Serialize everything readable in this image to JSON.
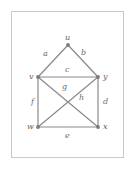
{
  "figure": {
    "kind": "graph-diagram",
    "frame": {
      "border_color": "#c9c9c9",
      "background_color": "#ffffff"
    },
    "style": {
      "edge_color": "#8a8a8a",
      "vertex_color": "#7a7a7a",
      "label_color": "#6b6b6b",
      "edge_width": 1.2,
      "vertex_radius": 1.9
    },
    "vertices": [
      {
        "id": "u",
        "label": "u",
        "x": 68,
        "y": 45,
        "label_x": 65,
        "label_y": 34
      },
      {
        "id": "v",
        "label": "v",
        "x": 38,
        "y": 77,
        "label_x": 29,
        "label_y": 73
      },
      {
        "id": "y",
        "label": "y",
        "x": 98,
        "y": 77,
        "label_x": 103,
        "label_y": 73
      },
      {
        "id": "w",
        "label": "w",
        "x": 38,
        "y": 127,
        "label_x": 27,
        "label_y": 123
      },
      {
        "id": "x",
        "label": "x",
        "x": 98,
        "y": 127,
        "label_x": 103,
        "label_y": 123
      }
    ],
    "edges": [
      {
        "id": "a",
        "label": "a",
        "from": "u",
        "to": "v",
        "label_x": 43,
        "label_y": 50
      },
      {
        "id": "b",
        "label": "b",
        "from": "u",
        "to": "y",
        "label_x": 81,
        "label_y": 49
      },
      {
        "id": "c",
        "label": "c",
        "from": "v",
        "to": "y",
        "label_x": 65,
        "label_y": 66
      },
      {
        "id": "d",
        "label": "d",
        "from": "y",
        "to": "x",
        "label_x": 103,
        "label_y": 98
      },
      {
        "id": "e",
        "label": "e",
        "from": "w",
        "to": "x",
        "label_x": 65,
        "label_y": 132
      },
      {
        "id": "f",
        "label": "f",
        "from": "v",
        "to": "w",
        "label_x": 31,
        "label_y": 98
      },
      {
        "id": "g",
        "label": "g",
        "from": "v",
        "to": "x",
        "label_x": 62,
        "label_y": 83
      },
      {
        "id": "h",
        "label": "h",
        "from": "y",
        "to": "w",
        "label_x": 79,
        "label_y": 94
      }
    ]
  }
}
